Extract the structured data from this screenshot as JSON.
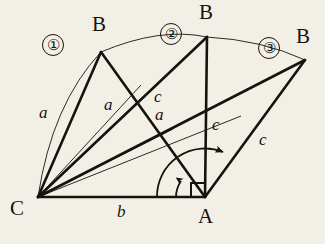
{
  "figure": {
    "background_color": "#f2f0e6",
    "ink_color": "#16130e",
    "width": 325,
    "height": 244
  },
  "steps": [
    {
      "id": "step-1",
      "label": "①",
      "x": 42,
      "y": 34
    },
    {
      "id": "step-2",
      "label": "②",
      "x": 160,
      "y": 23
    },
    {
      "id": "step-3",
      "label": "③",
      "x": 258,
      "y": 37
    }
  ],
  "vertices": [
    {
      "id": "vertex-c",
      "label": "C",
      "x": 10,
      "y": 198,
      "point": {
        "x": 38,
        "y": 197
      }
    },
    {
      "id": "vertex-a",
      "label": "A",
      "x": 198,
      "y": 206,
      "point": {
        "x": 205,
        "y": 197
      }
    },
    {
      "id": "vertex-b1",
      "label": "B",
      "x": 92,
      "y": 14,
      "point": {
        "x": 101,
        "y": 52
      }
    },
    {
      "id": "vertex-b2",
      "label": "B",
      "x": 199,
      "y": 2,
      "point": {
        "x": 207,
        "y": 37
      }
    },
    {
      "id": "vertex-b3",
      "label": "B",
      "x": 296,
      "y": 26,
      "point": {
        "x": 305,
        "y": 60
      }
    }
  ],
  "side_labels": [
    {
      "id": "side-a-1",
      "label": "a",
      "x": 39,
      "y": 104
    },
    {
      "id": "side-a-2",
      "label": "a",
      "x": 104,
      "y": 96
    },
    {
      "id": "side-c-1",
      "label": "c",
      "x": 154,
      "y": 88
    },
    {
      "id": "side-a-3",
      "label": "a",
      "x": 155,
      "y": 106
    },
    {
      "id": "side-c-2",
      "label": "c",
      "x": 212,
      "y": 116
    },
    {
      "id": "side-c-3",
      "label": "c",
      "x": 259,
      "y": 131
    },
    {
      "id": "side-b",
      "label": "b",
      "x": 117,
      "y": 203
    }
  ],
  "geometry": {
    "base": {
      "from": {
        "x": 38,
        "y": 197
      },
      "to": {
        "x": 205,
        "y": 197
      },
      "label": "b"
    },
    "triangles": [
      {
        "id": "triangle-1",
        "step": "①",
        "apex": {
          "x": 101,
          "y": 52
        },
        "sides": {
          "a": "C-B",
          "c": "A-B",
          "b": "C-A"
        }
      },
      {
        "id": "triangle-2",
        "step": "②",
        "apex": {
          "x": 207,
          "y": 37
        },
        "sides": {
          "a": "C-B",
          "c": "A-B",
          "b": "C-A"
        },
        "right_angle_at": "A"
      },
      {
        "id": "triangle-3",
        "step": "③",
        "apex": {
          "x": 305,
          "y": 60
        },
        "sides": {
          "a": "C-B",
          "c": "A-B",
          "b": "C-A"
        }
      }
    ],
    "rotation_arc": {
      "center": {
        "x": 205,
        "y": 197
      },
      "description": "angle arc at A sweeping counterclockwise with arrowheads"
    },
    "trace_arc": {
      "description": "thin arc showing path of B from position 1 through 2 to 3"
    }
  }
}
